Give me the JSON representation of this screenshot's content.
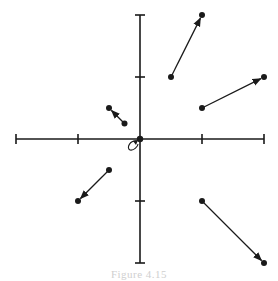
{
  "diagram": {
    "type": "vector-field",
    "colors": {
      "stroke": "#1a1a1a",
      "background": "#ffffff"
    },
    "origin_px": [
      140,
      139
    ],
    "unit_px": 62,
    "axes": {
      "x": {
        "min": -2,
        "max": 2,
        "ticks": [
          -2,
          -1,
          1,
          2
        ]
      },
      "y": {
        "min": -2,
        "max": 2,
        "ticks": [
          -2,
          -1,
          1,
          2
        ]
      }
    },
    "vectors": [
      {
        "from": [
          0.5,
          1
        ],
        "to": [
          1,
          2
        ]
      },
      {
        "from": [
          1,
          0.5
        ],
        "to": [
          2,
          1
        ]
      },
      {
        "from": [
          -0.25,
          0.25
        ],
        "to": [
          -0.5,
          0.5
        ]
      },
      {
        "from": [
          -0.5,
          -0.5
        ],
        "to": [
          -1,
          -1
        ]
      },
      {
        "from": [
          1,
          -1
        ],
        "to": [
          2,
          -2
        ]
      }
    ],
    "fixed_point": {
      "at": [
        0,
        0
      ],
      "marker": "loop-arrow-icon"
    }
  },
  "caption": "Figure 4.15"
}
